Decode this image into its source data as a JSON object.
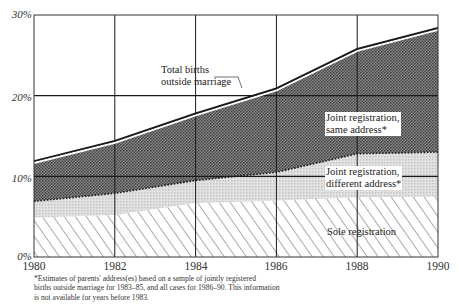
{
  "chart_data": {
    "type": "area",
    "stacked": true,
    "title": "",
    "xlabel": "",
    "ylabel": "",
    "x": [
      1980,
      1982,
      1984,
      1986,
      1988,
      1990
    ],
    "x_ticks": [
      "1980",
      "1982",
      "1984",
      "1986",
      "1988",
      "1990"
    ],
    "y_ticks": [
      "0%",
      "10%",
      "20%",
      "30%"
    ],
    "ylim": [
      0,
      30
    ],
    "xlim": [
      1980,
      1990
    ],
    "grid": true,
    "series": [
      {
        "name": "Sole registration",
        "values": [
          4.9,
          5.2,
          6.7,
          7.0,
          7.4,
          7.5
        ],
        "pattern": "hatch"
      },
      {
        "name": "Joint registration, different address*",
        "values": [
          2.0,
          2.7,
          2.8,
          3.5,
          5.4,
          5.5
        ],
        "pattern": "light-dots"
      },
      {
        "name": "Joint registration, same address*",
        "values": [
          5.0,
          6.5,
          8.3,
          10.4,
          13.0,
          15.4
        ],
        "pattern": "dark-dots"
      }
    ],
    "total_line": {
      "name": "Total births outside marriage",
      "values": [
        11.9,
        14.4,
        17.8,
        20.9,
        25.8,
        28.4
      ]
    },
    "boundaries": {
      "sole_top": [
        4.9,
        5.2,
        6.7,
        7.0,
        7.4,
        7.5
      ],
      "different_top": [
        6.9,
        7.9,
        9.5,
        10.5,
        12.8,
        13.0
      ],
      "total": [
        11.9,
        14.4,
        17.8,
        20.9,
        25.8,
        28.4
      ]
    },
    "annotations": [
      "Total births outside marriage",
      "Joint registration, same address*",
      "Joint registration, different address*",
      "Sole registration"
    ],
    "footnote": "*Estimates of parents' address(es) based on a sample of jointly registered births outside marriage for 1983–85, and all cases for 1986–90. This information is not available for years before 1983."
  },
  "labels": {
    "y": [
      "0%",
      "10%",
      "20%",
      "30%"
    ],
    "x": [
      "1980",
      "1982",
      "1984",
      "1986",
      "1988",
      "1990"
    ],
    "total_line": [
      "Total births",
      "outside marriage"
    ],
    "same_address": [
      "Joint registration,",
      "same address*"
    ],
    "different_address": [
      "Joint registration,",
      "different address*"
    ],
    "sole": "Sole registration",
    "footnote": [
      "*Estimates of parents' address(es) based on a sample of jointly registered",
      "births outside marriage for 1983–85, and all cases for 1986–90. This information",
      "is not available for years before 1983."
    ]
  },
  "colors": {
    "dark_area": "#6e6e6e",
    "light_area": "#d6d6d6",
    "hatch": "#555555",
    "line": "#1a1a1a",
    "grid": "#1a1a1a"
  }
}
